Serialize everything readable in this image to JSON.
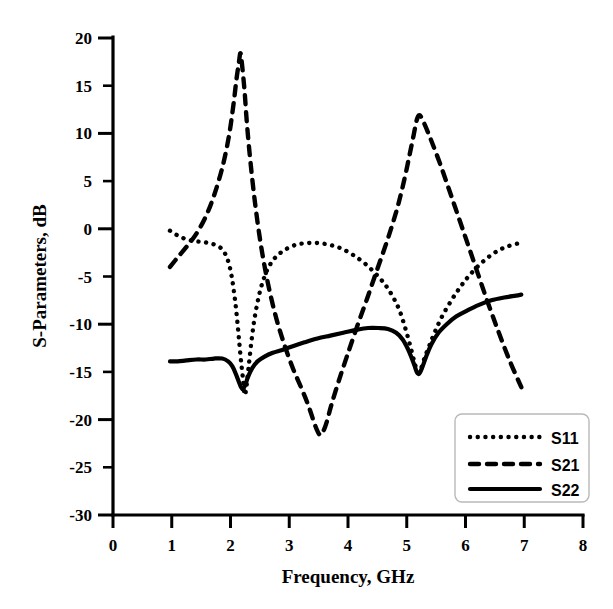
{
  "chart_data": {
    "type": "line",
    "title": "",
    "xlabel": "Frequency, GHz",
    "ylabel": "S-Parameters, dB",
    "xlim": [
      0,
      8
    ],
    "ylim": [
      -30,
      20
    ],
    "xticks": [
      0,
      1,
      2,
      3,
      4,
      5,
      6,
      7,
      8
    ],
    "xtick_labels": [
      "0",
      "1",
      "2",
      "3",
      "4",
      "5",
      "6",
      "7",
      "8"
    ],
    "yticks": [
      -30,
      -25,
      -20,
      -15,
      -10,
      -5,
      0,
      5,
      10,
      15,
      20
    ],
    "ytick_labels": [
      "-30",
      "-25",
      "-20",
      "-15",
      "-10",
      "-5",
      "0",
      "5",
      "10",
      "15",
      "20"
    ],
    "grid": false,
    "legend_position": "lower-right",
    "legend_entries": [
      "S11",
      "S21",
      "S22"
    ],
    "series": [
      {
        "name": "S11",
        "style": "dotted",
        "x": [
          0.97,
          1.1,
          1.25,
          1.4,
          1.55,
          1.7,
          1.85,
          1.95,
          2.02,
          2.08,
          2.13,
          2.17,
          2.21,
          2.24,
          2.27,
          2.31,
          2.36,
          2.42,
          2.5,
          2.58,
          2.66,
          2.75,
          2.9,
          3.1,
          3.3,
          3.5,
          3.7,
          3.9,
          4.1,
          4.3,
          4.5,
          4.65,
          4.78,
          4.88,
          4.96,
          5.03,
          5.09,
          5.14,
          5.19,
          5.24,
          5.3,
          5.38,
          5.48,
          5.6,
          5.75,
          5.9,
          6.05,
          6.25,
          6.45,
          6.65,
          6.85,
          6.95
        ],
        "y": [
          -0.2,
          -0.7,
          -1.1,
          -1.3,
          -1.4,
          -1.6,
          -2.1,
          -3.2,
          -5.0,
          -7.6,
          -10.6,
          -13.3,
          -15.6,
          -17.4,
          -16.6,
          -14.4,
          -11.6,
          -9.0,
          -6.6,
          -5.0,
          -3.9,
          -3.1,
          -2.3,
          -1.7,
          -1.5,
          -1.5,
          -1.7,
          -2.1,
          -2.8,
          -3.7,
          -4.9,
          -6.0,
          -7.3,
          -8.6,
          -10.1,
          -11.6,
          -13.0,
          -14.2,
          -15.1,
          -14.7,
          -13.6,
          -12.3,
          -10.8,
          -9.2,
          -7.6,
          -6.2,
          -5.0,
          -3.7,
          -2.7,
          -2.0,
          -1.6,
          -1.5
        ]
      },
      {
        "name": "S21",
        "style": "dashed",
        "x": [
          0.97,
          1.1,
          1.25,
          1.42,
          1.58,
          1.72,
          1.86,
          1.97,
          2.05,
          2.1,
          2.14,
          2.17,
          2.2,
          2.24,
          2.28,
          2.34,
          2.42,
          2.52,
          2.64,
          2.78,
          2.92,
          3.06,
          3.2,
          3.33,
          3.44,
          3.52,
          3.58,
          3.64,
          3.72,
          3.84,
          3.98,
          4.14,
          4.32,
          4.5,
          4.68,
          4.84,
          4.96,
          5.05,
          5.12,
          5.17,
          5.22,
          5.3,
          5.42,
          5.58,
          5.76,
          5.95,
          6.15,
          6.35,
          6.55,
          6.75,
          6.95
        ],
        "y": [
          -4.0,
          -3.0,
          -1.9,
          -0.5,
          1.3,
          3.5,
          6.4,
          9.6,
          13.0,
          15.6,
          17.3,
          18.4,
          17.0,
          14.4,
          11.0,
          7.0,
          2.6,
          -1.8,
          -5.8,
          -9.4,
          -12.2,
          -14.6,
          -16.6,
          -18.6,
          -20.6,
          -21.6,
          -21.2,
          -20.2,
          -18.4,
          -16.0,
          -13.4,
          -10.5,
          -7.4,
          -4.2,
          -1.0,
          2.2,
          5.2,
          7.8,
          9.9,
          11.4,
          11.9,
          11.0,
          9.2,
          6.6,
          3.4,
          0.0,
          -3.6,
          -7.2,
          -10.6,
          -13.8,
          -16.6
        ]
      },
      {
        "name": "S22",
        "style": "solid",
        "x": [
          0.97,
          1.1,
          1.25,
          1.42,
          1.58,
          1.72,
          1.86,
          1.96,
          2.03,
          2.09,
          2.14,
          2.18,
          2.21,
          2.25,
          2.3,
          2.37,
          2.46,
          2.58,
          2.72,
          2.88,
          3.06,
          3.26,
          3.48,
          3.7,
          3.92,
          4.14,
          4.34,
          4.52,
          4.68,
          4.82,
          4.93,
          5.02,
          5.08,
          5.13,
          5.17,
          5.21,
          5.26,
          5.33,
          5.42,
          5.54,
          5.68,
          5.84,
          6.02,
          6.22,
          6.44,
          6.66,
          6.86,
          6.95
        ],
        "y": [
          -13.9,
          -13.9,
          -13.8,
          -13.7,
          -13.7,
          -13.6,
          -13.6,
          -13.9,
          -14.4,
          -15.2,
          -16.0,
          -16.6,
          -16.8,
          -16.4,
          -15.5,
          -14.6,
          -13.9,
          -13.4,
          -13.0,
          -12.7,
          -12.3,
          -11.9,
          -11.5,
          -11.2,
          -10.9,
          -10.6,
          -10.4,
          -10.4,
          -10.5,
          -10.9,
          -11.6,
          -12.6,
          -13.5,
          -14.3,
          -15.0,
          -15.2,
          -14.6,
          -13.4,
          -12.1,
          -10.9,
          -10.0,
          -9.2,
          -8.6,
          -8.0,
          -7.5,
          -7.2,
          -7.0,
          -6.9
        ]
      }
    ]
  },
  "legend": {
    "items": [
      {
        "label": "S11",
        "style": "dotted"
      },
      {
        "label": "S21",
        "style": "dashed"
      },
      {
        "label": "S22",
        "style": "solid"
      }
    ]
  },
  "colors": {
    "foreground": "#000000",
    "background": "#ffffff",
    "legend_border": "#b9b9b9"
  }
}
